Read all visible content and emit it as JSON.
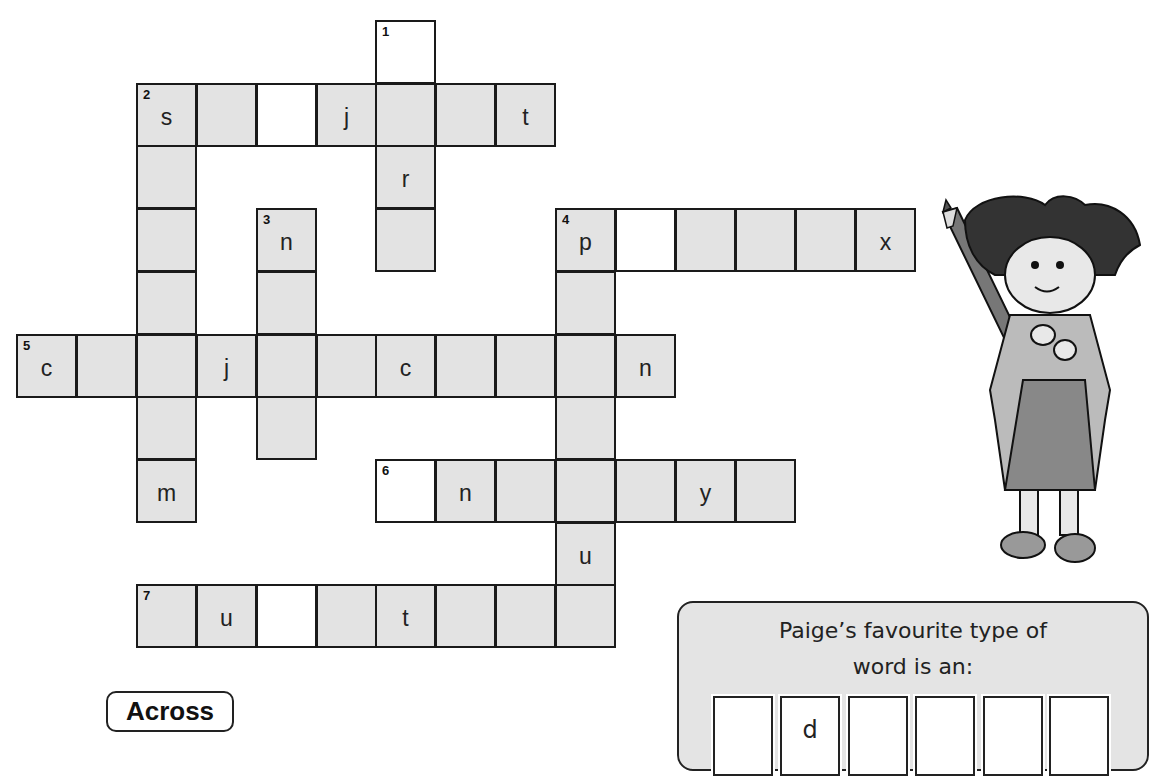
{
  "grid": {
    "origin_x": 16,
    "origin_y": 20,
    "col_pitch": 59.9,
    "row_pitch": 62.7,
    "cells": [
      {
        "r": 0,
        "c": 6,
        "num": "1",
        "letter": "",
        "white": true
      },
      {
        "r": 1,
        "c": 6,
        "num": "",
        "letter": "",
        "white": false
      },
      {
        "r": 2,
        "c": 6,
        "num": "",
        "letter": "r",
        "white": false
      },
      {
        "r": 3,
        "c": 6,
        "num": "",
        "letter": "",
        "white": false
      },
      {
        "r": 1,
        "c": 2,
        "num": "2",
        "letter": "s",
        "white": false
      },
      {
        "r": 1,
        "c": 3,
        "num": "",
        "letter": "",
        "white": false
      },
      {
        "r": 1,
        "c": 4,
        "num": "",
        "letter": "",
        "white": true
      },
      {
        "r": 1,
        "c": 5,
        "num": "",
        "letter": "j",
        "white": false
      },
      {
        "r": 1,
        "c": 7,
        "num": "",
        "letter": "",
        "white": false
      },
      {
        "r": 1,
        "c": 8,
        "num": "",
        "letter": "t",
        "white": false
      },
      {
        "r": 2,
        "c": 2,
        "num": "",
        "letter": "",
        "white": false
      },
      {
        "r": 3,
        "c": 2,
        "num": "",
        "letter": "",
        "white": false
      },
      {
        "r": 4,
        "c": 2,
        "num": "",
        "letter": "",
        "white": false
      },
      {
        "r": 6,
        "c": 2,
        "num": "",
        "letter": "",
        "white": false
      },
      {
        "r": 7,
        "c": 2,
        "num": "",
        "letter": "m",
        "white": false
      },
      {
        "r": 3,
        "c": 4,
        "num": "3",
        "letter": "n",
        "white": false
      },
      {
        "r": 4,
        "c": 4,
        "num": "",
        "letter": "",
        "white": false
      },
      {
        "r": 6,
        "c": 4,
        "num": "",
        "letter": "",
        "white": false
      },
      {
        "r": 3,
        "c": 9,
        "num": "4",
        "letter": "p",
        "white": false
      },
      {
        "r": 3,
        "c": 10,
        "num": "",
        "letter": "",
        "white": true
      },
      {
        "r": 3,
        "c": 11,
        "num": "",
        "letter": "",
        "white": false
      },
      {
        "r": 3,
        "c": 12,
        "num": "",
        "letter": "",
        "white": false
      },
      {
        "r": 3,
        "c": 13,
        "num": "",
        "letter": "",
        "white": false
      },
      {
        "r": 3,
        "c": 14,
        "num": "",
        "letter": "x",
        "white": false
      },
      {
        "r": 4,
        "c": 9,
        "num": "",
        "letter": "",
        "white": false
      },
      {
        "r": 6,
        "c": 9,
        "num": "",
        "letter": "",
        "white": false
      },
      {
        "r": 8,
        "c": 9,
        "num": "",
        "letter": "u",
        "white": false
      },
      {
        "r": 5,
        "c": 0,
        "num": "5",
        "letter": "c",
        "white": false
      },
      {
        "r": 5,
        "c": 1,
        "num": "",
        "letter": "",
        "white": false
      },
      {
        "r": 5,
        "c": 2,
        "num": "",
        "letter": "",
        "white": false
      },
      {
        "r": 5,
        "c": 3,
        "num": "",
        "letter": "j",
        "white": false
      },
      {
        "r": 5,
        "c": 4,
        "num": "",
        "letter": "",
        "white": false
      },
      {
        "r": 5,
        "c": 5,
        "num": "",
        "letter": "",
        "white": false
      },
      {
        "r": 5,
        "c": 6,
        "num": "",
        "letter": "c",
        "white": false
      },
      {
        "r": 5,
        "c": 7,
        "num": "",
        "letter": "",
        "white": false
      },
      {
        "r": 5,
        "c": 8,
        "num": "",
        "letter": "",
        "white": false
      },
      {
        "r": 5,
        "c": 9,
        "num": "",
        "letter": "",
        "white": false
      },
      {
        "r": 5,
        "c": 10,
        "num": "",
        "letter": "n",
        "white": false
      },
      {
        "r": 7,
        "c": 6,
        "num": "6",
        "letter": "",
        "white": true
      },
      {
        "r": 7,
        "c": 7,
        "num": "",
        "letter": "n",
        "white": false
      },
      {
        "r": 7,
        "c": 8,
        "num": "",
        "letter": "",
        "white": false
      },
      {
        "r": 7,
        "c": 9,
        "num": "",
        "letter": "",
        "white": false
      },
      {
        "r": 7,
        "c": 10,
        "num": "",
        "letter": "",
        "white": false
      },
      {
        "r": 7,
        "c": 11,
        "num": "",
        "letter": "y",
        "white": false
      },
      {
        "r": 7,
        "c": 12,
        "num": "",
        "letter": "",
        "white": false
      },
      {
        "r": 9,
        "c": 2,
        "num": "7",
        "letter": "",
        "white": false
      },
      {
        "r": 9,
        "c": 3,
        "num": "",
        "letter": "u",
        "white": false
      },
      {
        "r": 9,
        "c": 4,
        "num": "",
        "letter": "",
        "white": true
      },
      {
        "r": 9,
        "c": 5,
        "num": "",
        "letter": "",
        "white": false
      },
      {
        "r": 9,
        "c": 6,
        "num": "",
        "letter": "t",
        "white": false
      },
      {
        "r": 9,
        "c": 7,
        "num": "",
        "letter": "",
        "white": false
      },
      {
        "r": 9,
        "c": 8,
        "num": "",
        "letter": "",
        "white": false
      },
      {
        "r": 9,
        "c": 9,
        "num": "",
        "letter": "",
        "white": false
      }
    ]
  },
  "section_label": "Across",
  "panel": {
    "prompt_line1": "Paige’s favourite type of",
    "prompt_line2": "word is an:",
    "answer_boxes": [
      "",
      "d",
      "",
      "",
      "",
      ""
    ],
    "answer_box_x": [
      713,
      780,
      848,
      915,
      983,
      1049
    ]
  },
  "illustration": {
    "description": "cartoon child holding a large pencil",
    "icon": "child-with-pencil-illustration"
  },
  "colors": {
    "cell_fill": "#e3e3e3",
    "panel_fill": "#e4e4e4",
    "border": "#1a1a1a"
  }
}
